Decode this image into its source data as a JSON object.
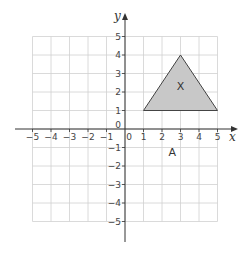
{
  "diagram": {
    "type": "coordinate-grid",
    "origin_px": [
      125,
      129
    ],
    "unit_px": 18.5,
    "x_range": [
      -5,
      5
    ],
    "y_range": [
      -5,
      5
    ],
    "axes": {
      "x_label": "x",
      "y_label": "y",
      "origin_label": "0"
    },
    "x_ticks": [
      "-5",
      "-4",
      "-3",
      "-2",
      "-1",
      "0",
      "1",
      "2",
      "3",
      "4",
      "5"
    ],
    "y_ticks": [
      "5",
      "4",
      "3",
      "2",
      "1",
      "-1",
      "-2",
      "-3",
      "-4",
      "-5"
    ],
    "shapes": [
      {
        "name": "X",
        "label": "X",
        "vertices": [
          [
            1,
            1
          ],
          [
            3,
            4
          ],
          [
            5,
            1
          ]
        ],
        "fill": "#c8c8c8",
        "stroke": "#444444",
        "label_pos": [
          3,
          2.3
        ]
      }
    ],
    "annotations": [
      {
        "text": "A",
        "pos": [
          2.55,
          -1.25
        ]
      }
    ],
    "colors": {
      "grid": "#d0d0d0",
      "axis": "#333333",
      "triangle_fill": "#c8c8c8"
    }
  }
}
